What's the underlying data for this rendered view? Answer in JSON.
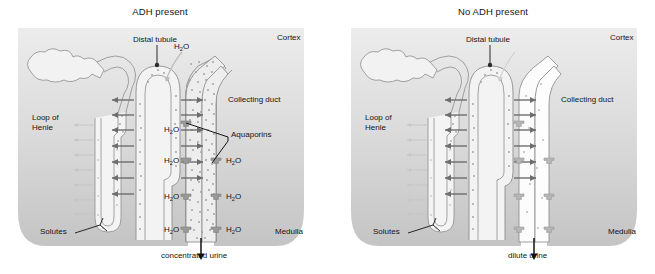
{
  "figure": {
    "title_left": "ADH present",
    "title_right": "No ADH present"
  },
  "panels": [
    {
      "id": "adh-present",
      "title": "ADH present",
      "region_labels": {
        "cortex": "Cortex",
        "medulla": "Medulla"
      },
      "structure_labels": {
        "distal_tubule": "Distal tubule",
        "loop_of_henle_line1": "Loop of",
        "loop_of_henle_line2": "Henle",
        "collecting_duct": "Collecting duct",
        "solutes": "Solutes",
        "aquaporins": "Aquaporins"
      },
      "water_labels": [
        {
          "text": "H",
          "sub": "2",
          "suffix": "O",
          "x": 174,
          "y": 43
        },
        {
          "text": "H",
          "sub": "2",
          "suffix": "O",
          "x": 164,
          "y": 126
        },
        {
          "text": "H",
          "sub": "2",
          "suffix": "O",
          "x": 164,
          "y": 157
        },
        {
          "text": "H",
          "sub": "2",
          "suffix": "O",
          "x": 164,
          "y": 193
        },
        {
          "text": "H",
          "sub": "2",
          "suffix": "O",
          "x": 164,
          "y": 226
        },
        {
          "text": "H",
          "sub": "2",
          "suffix": "O",
          "x": 230,
          "y": 157
        },
        {
          "text": "H",
          "sub": "2",
          "suffix": "O",
          "x": 230,
          "y": 193
        },
        {
          "text": "H",
          "sub": "2",
          "suffix": "O",
          "x": 230,
          "y": 226
        }
      ],
      "output_label": "concentrated urine"
    },
    {
      "id": "no-adh-present",
      "title": "No ADH present",
      "region_labels": {
        "cortex": "Cortex",
        "medulla": "Medulla"
      },
      "structure_labels": {
        "distal_tubule": "Distal tubule",
        "loop_of_henle_line1": "Loop of",
        "loop_of_henle_line2": "Henle",
        "collecting_duct": "Collecting duct",
        "solutes": "Solutes",
        "aquaporins": ""
      },
      "water_labels": [],
      "output_label": "dilute urine"
    }
  ],
  "colors": {
    "cortex_bg": "#e6e6e6",
    "medulla_bg": "#c9c9c9",
    "tubule_stroke": "#8e8e8e",
    "tubule_fill": "#f0f0f0",
    "solute_dot": "#a8a8a8",
    "arrow_dark": "#6b6b6b",
    "arrow_light": "#c4c4c4",
    "text": "#141414",
    "page_bg": "#ffffff"
  }
}
